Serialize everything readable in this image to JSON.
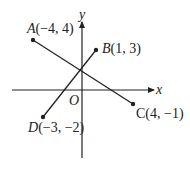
{
  "diagram": {
    "axes": {
      "x_label": "x",
      "y_label": "y",
      "origin_label": "O"
    },
    "points": [
      {
        "name": "A",
        "coord": "(−4, 4)",
        "x": -4,
        "y": 4
      },
      {
        "name": "B",
        "coord": "(1, 3)",
        "x": 1,
        "y": 3
      },
      {
        "name": "C",
        "coord": "(4, −1)",
        "x": 4,
        "y": -1
      },
      {
        "name": "D",
        "coord": "(−3, −2)",
        "x": -3,
        "y": -2
      }
    ],
    "segments": [
      {
        "from": "A",
        "to": "C"
      },
      {
        "from": "D",
        "to": "B"
      }
    ],
    "colors": {
      "ink": "#222222",
      "background": "#ffffff"
    }
  }
}
